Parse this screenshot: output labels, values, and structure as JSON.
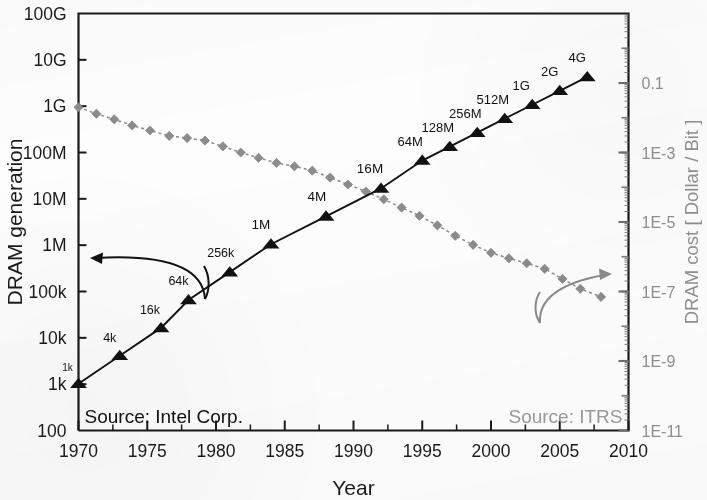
{
  "chart_data": {
    "type": "scatter",
    "title": "",
    "xlabel": "Year",
    "ylabel": "DRAM generation",
    "y2label": "DRAM cost [ Dollar / Bit ]",
    "xlim": [
      1970,
      2010
    ],
    "xticks": [
      1970,
      1975,
      1980,
      1985,
      1990,
      1995,
      2000,
      2005,
      2010
    ],
    "xtick_labels": [
      "1970",
      "1975",
      "1980",
      "1985",
      "1990",
      "1995",
      "2000",
      "2005",
      "2010"
    ],
    "x_minor_tick_step": 2.5,
    "ylim_log10": [
      2,
      11
    ],
    "ytick_labels": [
      "100",
      "1k",
      "10k",
      "100k",
      "1M",
      "10M",
      "100M",
      "1G",
      "10G",
      "100G"
    ],
    "ytick_log10": [
      2,
      3,
      4,
      5,
      6,
      7,
      8,
      9,
      10,
      11
    ],
    "y2lim_log10": [
      -11,
      1
    ],
    "y2tick_labels": [
      "1E-11",
      "1E-9",
      "1E-7",
      "1E-5",
      "1E-3",
      "0.1"
    ],
    "y2tick_log10": [
      -11,
      -9,
      -7,
      -5,
      -3,
      -1
    ],
    "y2_minor_ticks": true,
    "grid": false,
    "legend_position": "none",
    "scales": {
      "x": "linear",
      "y": "log",
      "y2": "log"
    },
    "series": [
      {
        "name": "DRAM generation",
        "axis": "left",
        "color": "#111111",
        "marker": "triangle-up",
        "line": "solid",
        "point_labels_shown": true,
        "points": [
          {
            "x": 1970,
            "label": "1k",
            "bits": 1024
          },
          {
            "x": 1973,
            "label": "4k",
            "bits": 4096
          },
          {
            "x": 1976,
            "label": "16k",
            "bits": 16384
          },
          {
            "x": 1978,
            "label": "64k",
            "bits": 65536
          },
          {
            "x": 1981,
            "label": "256k",
            "bits": 262144
          },
          {
            "x": 1984,
            "label": "1M",
            "bits": 1048576
          },
          {
            "x": 1988,
            "label": "4M",
            "bits": 4194304
          },
          {
            "x": 1992,
            "label": "16M",
            "bits": 16777216
          },
          {
            "x": 1995,
            "label": "64M",
            "bits": 67108864
          },
          {
            "x": 1997,
            "label": "128M",
            "bits": 134217728
          },
          {
            "x": 1999,
            "label": "256M",
            "bits": 268435456
          },
          {
            "x": 2001,
            "label": "512M",
            "bits": 536870912
          },
          {
            "x": 2003,
            "label": "1G",
            "bits": 1073741824
          },
          {
            "x": 2005,
            "label": "2G",
            "bits": 2147483648
          },
          {
            "x": 2007,
            "label": "4G",
            "bits": 4294967296
          }
        ]
      },
      {
        "name": "DRAM cost",
        "axis": "right",
        "color": "#8c8c8c",
        "marker": "diamond",
        "line": "dashed",
        "point_labels_shown": false,
        "points": [
          {
            "x": 1970.0,
            "cost": 0.02
          },
          {
            "x": 1971.3,
            "cost": 0.013
          },
          {
            "x": 1972.6,
            "cost": 0.009
          },
          {
            "x": 1973.9,
            "cost": 0.006
          },
          {
            "x": 1975.2,
            "cost": 0.0043
          },
          {
            "x": 1976.6,
            "cost": 0.003
          },
          {
            "x": 1977.9,
            "cost": 0.0026
          },
          {
            "x": 1979.2,
            "cost": 0.0022
          },
          {
            "x": 1980.5,
            "cost": 0.0015
          },
          {
            "x": 1981.8,
            "cost": 0.001
          },
          {
            "x": 1983.1,
            "cost": 0.0007
          },
          {
            "x": 1984.4,
            "cost": 0.0005
          },
          {
            "x": 1985.7,
            "cost": 0.0004
          },
          {
            "x": 1987.0,
            "cost": 0.0003
          },
          {
            "x": 1988.3,
            "cost": 0.00019
          },
          {
            "x": 1989.6,
            "cost": 0.00012
          },
          {
            "x": 1990.9,
            "cost": 7.5e-05
          },
          {
            "x": 1992.2,
            "cost": 4.5e-05
          },
          {
            "x": 1993.5,
            "cost": 2.6e-05
          },
          {
            "x": 1994.8,
            "cost": 1.5e-05
          },
          {
            "x": 1996.1,
            "cost": 8e-06
          },
          {
            "x": 1997.4,
            "cost": 4e-06
          },
          {
            "x": 1998.7,
            "cost": 2.2e-06
          },
          {
            "x": 2000.0,
            "cost": 1.3e-06
          },
          {
            "x": 2001.3,
            "cost": 9e-07
          },
          {
            "x": 2002.6,
            "cost": 6.5e-07
          },
          {
            "x": 2003.9,
            "cost": 4.5e-07
          },
          {
            "x": 2005.2,
            "cost": 2.3e-07
          },
          {
            "x": 2006.5,
            "cost": 1.2e-07
          },
          {
            "x": 2008.0,
            "cost": 7e-08
          }
        ]
      }
    ],
    "annotations": [
      {
        "id": "left-arrow",
        "text": "",
        "kind": "curved-arrow",
        "direction": "left",
        "color": "#111111",
        "points_to": "DRAM generation"
      },
      {
        "id": "right-arrow",
        "text": "",
        "kind": "curved-arrow",
        "direction": "right",
        "color": "#8c8c8c",
        "points_to": "DRAM cost"
      },
      {
        "id": "source-left",
        "text": "Source: Intel Corp.",
        "color": "#111111"
      },
      {
        "id": "source-right",
        "text": "Source: ITRS",
        "color": "#9a9a9a"
      }
    ]
  },
  "colors": {
    "generation": "#111111",
    "cost": "#8c8c8c",
    "cost_label": "#8f8f8f",
    "axis": "#1a1a1a",
    "background": "#fdfdfd"
  }
}
